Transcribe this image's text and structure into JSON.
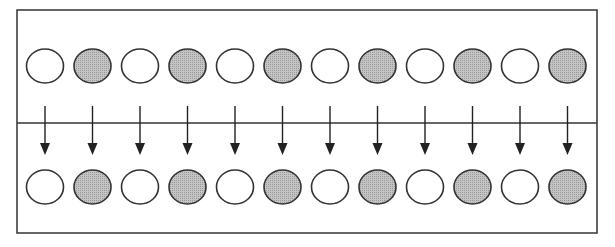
{
  "diagram": {
    "frame": {
      "x": 17,
      "y": 10,
      "width": 580,
      "height": 223,
      "stroke": "#333333"
    },
    "divider": {
      "y": 123
    },
    "colors": {
      "filled": "#b8b8b8",
      "empty": "#ffffff",
      "stroke": "#333333",
      "arrow": "#222222"
    },
    "circle": {
      "rx": 18.5,
      "ry": 17,
      "first_cx": 45,
      "spacing": 47.5
    },
    "top_row": {
      "cy": 66,
      "pattern": [
        "empty",
        "filled",
        "empty",
        "filled",
        "empty",
        "filled",
        "empty",
        "filled",
        "empty",
        "filled",
        "empty",
        "filled"
      ]
    },
    "arrows": {
      "count": 12,
      "y1": 106,
      "y2": 155
    },
    "bottom_row": {
      "cy": 187,
      "pattern": [
        "empty",
        "filled",
        "empty",
        "filled",
        "empty",
        "filled",
        "empty",
        "filled",
        "empty",
        "filled",
        "empty",
        "filled"
      ]
    }
  }
}
